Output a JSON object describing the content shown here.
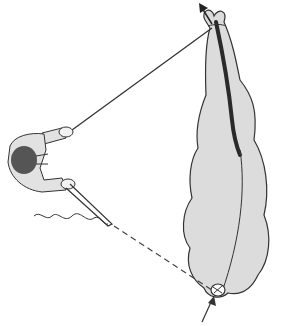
{
  "figure": {
    "colors": {
      "background": "#ffffff",
      "organ_fill": "#dcdcdc",
      "outline": "#333333",
      "dark_stripe": "#2a2a2a",
      "head": "#555555",
      "clothing": "#e2e2e2"
    },
    "elements": {
      "person": "top-view figure holding two lines",
      "upper_line": "solid line from right hand to top of organ",
      "lower_line": "rod from left hand, continuing as dashed line to knot at bottom of organ",
      "wavy_line": "squiggle trailing from rod",
      "top_arrow": "arrow pointing up-left at top of organ",
      "bottom_arrow": "arrow pointing up into knot at bottom",
      "knot": "tied knot at bottom tip of organ"
    }
  }
}
